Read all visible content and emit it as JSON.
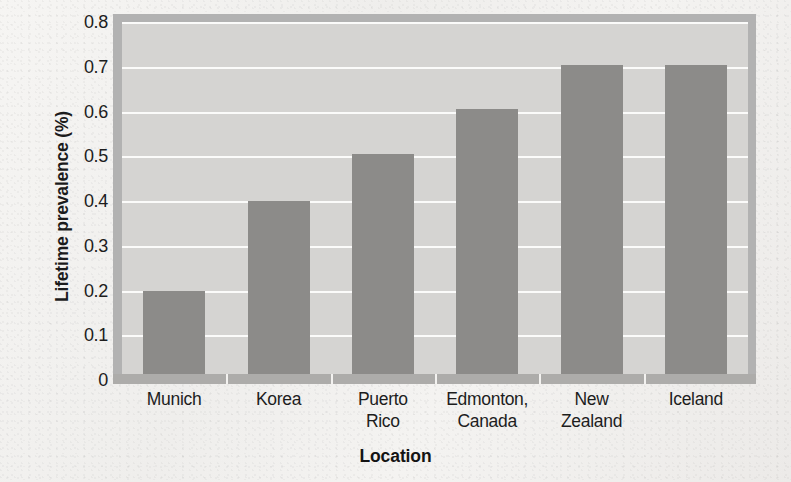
{
  "chart_data": {
    "type": "bar",
    "title": "",
    "xlabel": "Location",
    "ylabel": "Lifetime prevalence (%)",
    "categories": [
      "Munich",
      "Korea",
      "Puerto Rico",
      "Edmonton, Canada",
      "New Zealand",
      "Iceland"
    ],
    "category_lines": [
      [
        "Munich"
      ],
      [
        "Korea"
      ],
      [
        "Puerto",
        "Rico"
      ],
      [
        "Edmonton,",
        "Canada"
      ],
      [
        "New",
        "Zealand"
      ],
      [
        "Iceland"
      ]
    ],
    "values": [
      0.2,
      0.4,
      0.505,
      0.605,
      0.705,
      0.705
    ],
    "ylim": [
      0,
      0.8
    ],
    "ytick_values": [
      0.8,
      0.7,
      0.6,
      0.5,
      0.4,
      0.3,
      0.2,
      0.1,
      0
    ],
    "ytick_labels": [
      "0.8",
      "0.7",
      "0.6",
      "0.5",
      "0.4",
      "0.3",
      "0.2",
      "0.1",
      "0"
    ],
    "grid": true,
    "grid_color": "#fbfbfa",
    "legend": "none",
    "bar_color": "#8c8b89",
    "plot_background": "#d5d4d2",
    "frame_color": "#b2b2b2",
    "page_background": "#f2f1ef"
  }
}
